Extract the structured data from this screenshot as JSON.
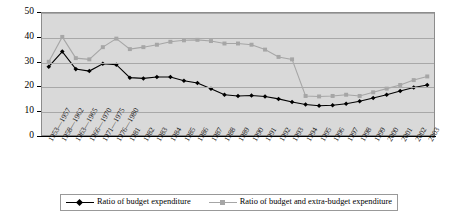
{
  "chart_data": {
    "type": "line",
    "title": "",
    "subtitle": "",
    "xlabel": "",
    "ylabel": "",
    "ylim": [
      0,
      50
    ],
    "ytick_labels": [
      "0",
      "10",
      "20",
      "30",
      "40",
      "50"
    ],
    "ytick_values": [
      0,
      10,
      20,
      30,
      40,
      50
    ],
    "grid": true,
    "legend_position": "bottom",
    "plot_background": "#d9d9d9",
    "categories": [
      "1953—1957",
      "1958—1962",
      "1963—1965",
      "1966—1970",
      "1971—1975",
      "1976—1980",
      "1981",
      "1982",
      "1983",
      "1984",
      "1985",
      "1986",
      "1987",
      "1988",
      "1989",
      "1990",
      "1991",
      "1992",
      "1993",
      "1994",
      "1995",
      "1996",
      "1997",
      "1998",
      "1999",
      "2000",
      "2001",
      "2002",
      "2003"
    ],
    "series": [
      {
        "name": "Ratio of budget expenditure",
        "color": "#000000",
        "marker": "diamond",
        "values": [
          28.0,
          34.2,
          27.0,
          26.2,
          29.2,
          28.8,
          23.5,
          23.2,
          23.8,
          23.8,
          22.2,
          21.3,
          19.0,
          16.5,
          16.0,
          16.2,
          15.8,
          14.8,
          13.5,
          12.5,
          12.0,
          12.2,
          12.8,
          13.8,
          15.2,
          16.5,
          18.0,
          19.5,
          20.5
        ]
      },
      {
        "name": "Ratio of budget and extra-budget expenditure",
        "color": "#a6a6a6",
        "marker": "square",
        "values": [
          30.0,
          40.2,
          31.5,
          31.0,
          36.0,
          39.5,
          35.2,
          36.0,
          37.0,
          38.2,
          38.8,
          39.0,
          38.5,
          37.5,
          37.5,
          37.0,
          35.0,
          32.0,
          31.0,
          16.0,
          15.8,
          16.0,
          16.5,
          16.0,
          17.5,
          19.0,
          20.5,
          22.5,
          24.0
        ]
      }
    ]
  }
}
